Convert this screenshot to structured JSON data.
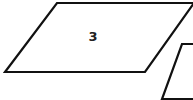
{
  "shapes": [
    {
      "type": "parallelogram",
      "label": "3"
    },
    {
      "type": "parallelogram",
      "label": ""
    }
  ],
  "colors": {
    "stroke": "#111111",
    "fill": "#ffffff"
  }
}
